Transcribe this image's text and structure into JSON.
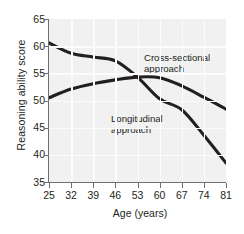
{
  "chart_data": {
    "type": "line",
    "title": "",
    "subtitle": "",
    "xlabel": "Age (years)",
    "ylabel": "Reasoning ability score",
    "x": [
      25,
      32,
      39,
      46,
      53,
      60,
      67,
      74,
      81
    ],
    "xticklabels": [
      "25",
      "32",
      "39",
      "46",
      "53",
      "60",
      "67",
      "74",
      "81"
    ],
    "yticklabels": [
      "65",
      "60",
      "55",
      "50",
      "45",
      "40",
      "35"
    ],
    "yticks": [
      65,
      60,
      55,
      50,
      45,
      40,
      35
    ],
    "xlim": [
      25,
      81
    ],
    "ylim": [
      35,
      65
    ],
    "grid": true,
    "grid_color": "#fcfcfc",
    "plot_background": "#f1f1f1",
    "page_background": "#ffffff",
    "line_color": "#231f20",
    "legend_position": "in-plot annotations",
    "series": [
      {
        "name": "Cross-sectional approach",
        "label": "Cross-sectional approach",
        "values": [
          60.6,
          58.7,
          58.0,
          57.3,
          54.3,
          50.3,
          48.3,
          43.6,
          38.5
        ]
      },
      {
        "name": "Longitudinal approach",
        "label": "Longitudinal\napproach",
        "values": [
          50.5,
          52.1,
          53.1,
          53.8,
          54.3,
          54.2,
          52.7,
          50.6,
          48.4
        ]
      }
    ],
    "annotations": [
      {
        "text": "Cross-sectional approach",
        "x": 46,
        "y": 61.5
      },
      {
        "text": "Longitudinal\napproach",
        "x": 33,
        "y": 50.0
      }
    ]
  }
}
